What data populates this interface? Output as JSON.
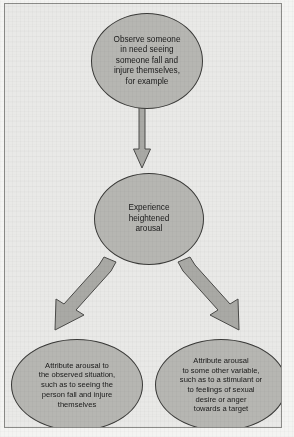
{
  "figure": {
    "background_color": "#e9e9e7",
    "node_fill_color": "#b6b6b2",
    "node_border_color": "#3a3a38",
    "arrow_fill_color": "#a9a9a5",
    "nodes": [
      {
        "id": "observe",
        "shape": "ellipse",
        "text": "Observe someone\nin need seeing\nsomeone fall and\ninjure themselves,\nfor example"
      },
      {
        "id": "arousal",
        "shape": "ellipse",
        "text": "Experience\nheightened\narousal"
      },
      {
        "id": "attribute-situation",
        "shape": "ellipse",
        "text": "Attribute arousal to\nthe observed situation,\nsuch as to seeing the\nperson fall and injure\nthemselves"
      },
      {
        "id": "attribute-other",
        "shape": "ellipse",
        "text": "Attribute arousal\nto some other variable,\nsuch as to a stimulant or\nto feelings of sexual\ndesire or anger\ntowards a target"
      }
    ],
    "arrows": [
      {
        "id": "observe-to-arousal",
        "direction": "down",
        "icon": "arrow-down-icon"
      },
      {
        "id": "arousal-to-situation",
        "direction": "down-left",
        "icon": "arrow-down-left-icon"
      },
      {
        "id": "arousal-to-other",
        "direction": "down-right",
        "icon": "arrow-down-right-icon"
      }
    ]
  }
}
